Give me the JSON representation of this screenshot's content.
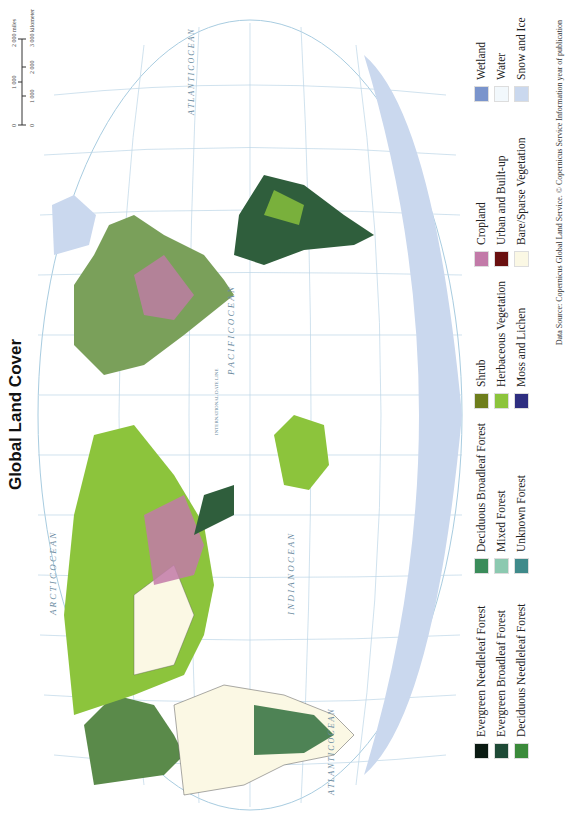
{
  "title": "Global Land Cover",
  "scale_bar": {
    "miles_ticks": [
      "0",
      "1 000",
      "2 000 miles"
    ],
    "km_ticks": [
      "0",
      "1 000",
      "2 000",
      "3 000 kilometers"
    ]
  },
  "ocean_labels": {
    "arctic": "A R C T I C   O C E A N",
    "pacific": "P A C I F I C   O C E A N",
    "indian": "I N D I A N   O C E A N",
    "atlantic_north": "A T L A N T I C   O C E A N",
    "atlantic_south": "A T L A N T I C   O C E A N"
  },
  "map_lines": {
    "date_line": "INTERNATIONAL DATE LINE",
    "longitudes": [
      "90°",
      "60°",
      "30°",
      "0°",
      "30°",
      "60°",
      "90°",
      "120°",
      "150°",
      "180°",
      "150°",
      "120°",
      "90°",
      "60°",
      "30°",
      "0°"
    ],
    "latitudes": [
      "60°",
      "30°",
      "0°",
      "30°",
      "60°"
    ],
    "tropics": [
      "Tropic of Cancer",
      "Equator",
      "Tropic of Capricorn",
      "Arctic Circle",
      "Antarctic Circle"
    ]
  },
  "legend": {
    "groups": [
      {
        "items": [
          {
            "label": "Evergreen Needleleaf Forest",
            "color": "#0a1a12"
          },
          {
            "label": "Evergreen Broadleaf Forest",
            "color": "#1e4a36"
          },
          {
            "label": "Deciduous Needleleaf Forest",
            "color": "#3a8a3a"
          }
        ]
      },
      {
        "items": [
          {
            "label": "Deciduous Broadleaf Forest",
            "color": "#3a8c5a"
          },
          {
            "label": "Mixed Forest",
            "color": "#8cc9b0"
          },
          {
            "label": "Unknown Forest",
            "color": "#3f8a8a"
          }
        ]
      },
      {
        "items": [
          {
            "label": "Shrub",
            "color": "#6e7e1c"
          },
          {
            "label": "Herbaceous Vegetation",
            "color": "#8cc43c"
          },
          {
            "label": "Moss and Lichen",
            "color": "#2e2e80"
          }
        ]
      },
      {
        "items": [
          {
            "label": "Cropland",
            "color": "#c27aa8"
          },
          {
            "label": "Urban and Built-up",
            "color": "#6a1010"
          },
          {
            "label": "Bare/Sparse Vegetation",
            "color": "#fbf8e4"
          }
        ]
      },
      {
        "items": [
          {
            "label": "Wetland",
            "color": "#7a94cc"
          },
          {
            "label": "Water",
            "color": "#f2f8fc"
          },
          {
            "label": "Snow and Ice",
            "color": "#cad8ee"
          }
        ]
      }
    ]
  },
  "source": "Data Source: Copernicus Global Land Service. © Copernicus Service Information year of publication",
  "colors": {
    "ocean": "#ffffff",
    "graticule": "#a8cce0",
    "ice": "#cad8ee",
    "label": "#6a8aa0"
  }
}
